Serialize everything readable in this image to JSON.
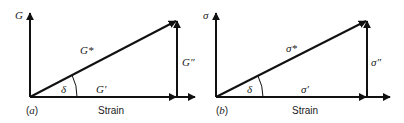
{
  "panels": [
    {
      "id": "a",
      "tag": "(a)",
      "tag_letter": "a",
      "y_axis_label": "G",
      "hypotenuse_label": "G*",
      "horizontal_label": "G′",
      "vertical_label": "G″",
      "angle_label": "δ",
      "x_axis_label": "Strain"
    },
    {
      "id": "b",
      "tag": "(b)",
      "tag_letter": "b",
      "y_axis_label": "σ",
      "hypotenuse_label": "σ*",
      "horizontal_label": "σ′",
      "vertical_label": "σ″",
      "angle_label": "δ",
      "x_axis_label": "Strain"
    }
  ],
  "paren_open": "(",
  "paren_close": ")"
}
